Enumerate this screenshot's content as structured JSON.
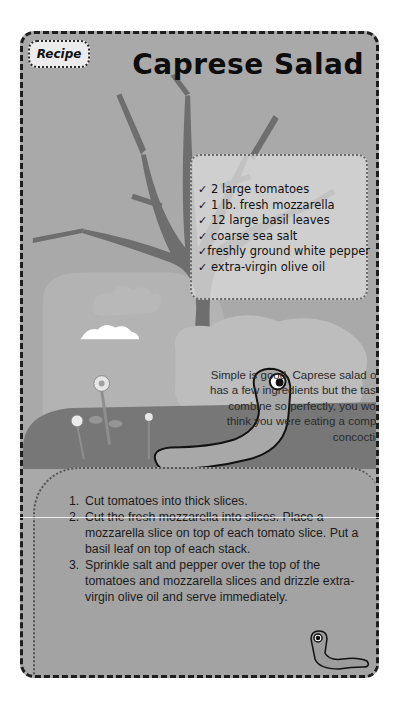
{
  "tag": {
    "label": "Recipe"
  },
  "title": "Caprese Salad",
  "ingredients": {
    "icon": "check-icon",
    "items": [
      "2 large tomatoes",
      "1 lb. fresh mozzarella",
      "12 large basil leaves",
      "coarse sea salt",
      "freshly ground white pepper",
      "extra-virgin olive oil"
    ]
  },
  "blurb": "Simple is good. Caprese salad only has a few ingredients but the tastes combine so perfectly, you would think you were eating a complex concoction.",
  "steps": [
    {
      "num": "1.",
      "text": "Cut tomatoes into thick slices."
    },
    {
      "num": "2.",
      "text": "Cut the fresh mozzarella into slices. Place a mozzarella slice on top of each tomato slice. Put a basil leaf on top of each stack."
    },
    {
      "num": "3.",
      "text": "Sprinkle salt and pepper over the top of the tomatoes and mozzarella slices and drizzle extra-virgin olive oil and serve immediately."
    }
  ],
  "illustrations": [
    "tree-illustration",
    "cloud-illustration",
    "flower-illustration",
    "worm-illustration",
    "small-worm-illustration"
  ],
  "colors": {
    "card_bg": "#a9a9a9",
    "tree": "#6e6e6e",
    "hill": "#777777",
    "panel": "#dadada",
    "text": "#111111"
  }
}
